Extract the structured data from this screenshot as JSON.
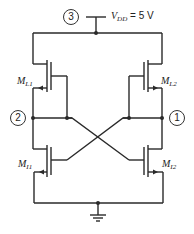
{
  "diagram": {
    "type": "circuit-schematic",
    "supply": {
      "node": "3",
      "label_main": "V",
      "label_sub": "DD",
      "label_value": " = 5 V"
    },
    "nodes": [
      {
        "id": "node-1",
        "label": "1"
      },
      {
        "id": "node-2",
        "label": "2"
      },
      {
        "id": "node-3",
        "label": "3"
      }
    ],
    "transistors": [
      {
        "id": "ML1",
        "main": "M",
        "sub": "L1",
        "role": "load"
      },
      {
        "id": "ML2",
        "main": "M",
        "sub": "L2",
        "role": "load"
      },
      {
        "id": "MI1",
        "main": "M",
        "sub": "I1",
        "role": "inverter"
      },
      {
        "id": "MI2",
        "main": "M",
        "sub": "I2",
        "role": "inverter"
      }
    ],
    "ground": "ground",
    "colors": {
      "wire": "#2a2a2a",
      "background": "#ffffff"
    }
  }
}
